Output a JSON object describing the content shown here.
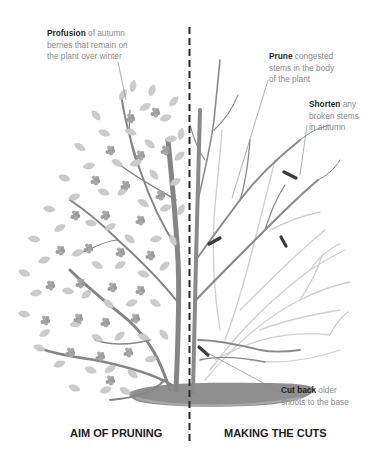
{
  "diagram": {
    "type": "pruning-illustration",
    "colors": {
      "background": "#ffffff",
      "divider": "#2a2a2a",
      "trunk": "#7a7a7a",
      "branch_light": "#c4c4c4",
      "foliage": "#c9c9c9",
      "berries": "#9e9e9e",
      "cut_mark": "#3a3a3a",
      "ground": "#8c8c8c",
      "annotation_text": "#8a8a8a",
      "annotation_bold": "#1f1f1f"
    },
    "left_panel": {
      "caption": "AIM OF PRUNING",
      "annotations": [
        {
          "bold": "Profusion",
          "line1_rest": " of autumn",
          "line2": "berries that remain on",
          "line3": "the plant over winter"
        }
      ]
    },
    "right_panel": {
      "caption": "MAKING THE CUTS",
      "annotations": [
        {
          "bold": "Prune",
          "line1_rest": " congested",
          "line2": "stems in the body",
          "line3": "of the plant"
        },
        {
          "bold": "Shorten",
          "line1_rest": " any",
          "line2": "broken stems",
          "line3": "in autumn"
        },
        {
          "bold": "Cut back",
          "line1_rest": " older",
          "line2": "shoots to the base"
        }
      ]
    }
  }
}
